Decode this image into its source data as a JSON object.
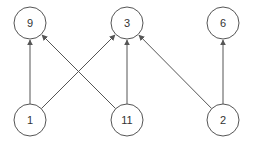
{
  "graph": {
    "nodes": [
      {
        "id": "n9",
        "label": "9",
        "x": 30,
        "y": 23
      },
      {
        "id": "n3",
        "label": "3",
        "x": 127,
        "y": 23
      },
      {
        "id": "n6",
        "label": "6",
        "x": 223,
        "y": 23
      },
      {
        "id": "n1",
        "label": "1",
        "x": 30,
        "y": 120
      },
      {
        "id": "n11",
        "label": "11",
        "x": 127,
        "y": 120
      },
      {
        "id": "n2",
        "label": "2",
        "x": 223,
        "y": 120
      }
    ],
    "edges": [
      {
        "from": "1",
        "to": "9"
      },
      {
        "from": "1",
        "to": "3"
      },
      {
        "from": "11",
        "to": "9"
      },
      {
        "from": "11",
        "to": "3"
      },
      {
        "from": "2",
        "to": "3"
      },
      {
        "from": "2",
        "to": "6"
      }
    ],
    "node_radius": 16
  }
}
